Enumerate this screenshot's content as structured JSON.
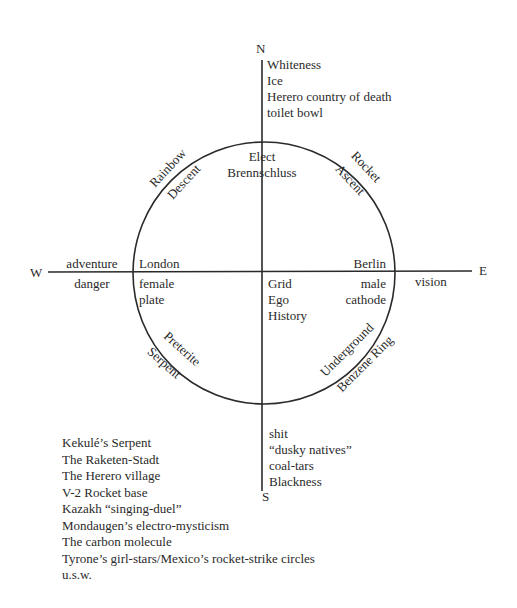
{
  "compass": {
    "north": "N",
    "south": "S",
    "east": "E",
    "west": "W"
  },
  "north_list": [
    "Whiteness",
    "Ice",
    "Herero country of death",
    "toilet bowl"
  ],
  "south_list": [
    "shit",
    "“dusky natives”",
    "coal-tars",
    "Blackness"
  ],
  "west_outside": {
    "above": "adventure",
    "below": "danger"
  },
  "east_outside": {
    "below": "vision"
  },
  "top_center": [
    "Elect",
    "Brennschluss"
  ],
  "arc_labels": {
    "upper_left_outer": "Rainbow",
    "upper_left_inner": "Descent",
    "upper_right_outer": "Rocket",
    "upper_right_inner": "Ascent",
    "lower_left_inner": "Preterite",
    "lower_left_outer": "Serpent",
    "lower_right_inner": "Underground",
    "lower_right_outer": "Benzene Ring"
  },
  "west_inside": {
    "above": "London",
    "below": [
      "female",
      "plate"
    ]
  },
  "east_inside": {
    "above": "Berlin",
    "below": [
      "male",
      "cathode"
    ]
  },
  "center_list": [
    "Grid",
    "Ego",
    "History"
  ],
  "legend": [
    "Kekulé’s Serpent",
    "The Raketen-Stadt",
    "The Herero village",
    "V-2 Rocket base",
    "Kazakh “singing-duel”",
    "Mondaugen’s electro-mysticism",
    "The carbon molecule",
    "Tyrone’s girl-stars/Mexico’s rocket-strike circles",
    "u.s.w."
  ],
  "colors": {
    "ink": "#2a2a2a",
    "paper": "#ffffff"
  }
}
